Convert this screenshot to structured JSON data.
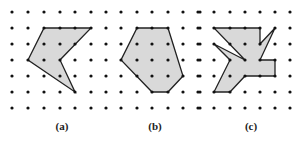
{
  "figure": {
    "colors": {
      "dot": "#111111",
      "fill": "#d9d9d9",
      "stroke": "#222222"
    },
    "panels": [
      {
        "label": "(a)",
        "label_x": 62,
        "grid": {
          "xs": [
            12,
            28,
            44,
            60,
            75,
            91
          ],
          "ys": [
            12,
            28,
            44,
            60,
            76,
            92,
            108
          ]
        },
        "polygon": [
          [
            44,
            28
          ],
          [
            91,
            28
          ],
          [
            60,
            60
          ],
          [
            75,
            92
          ],
          [
            28,
            60
          ]
        ]
      },
      {
        "label": "(b)",
        "label_x": 155,
        "grid": {
          "xs": [
            106,
            121,
            137,
            152,
            168,
            183,
            198
          ],
          "ys": [
            12,
            28,
            44,
            60,
            76,
            92,
            108
          ]
        },
        "polygon": [
          [
            137,
            28
          ],
          [
            168,
            28
          ],
          [
            183,
            76
          ],
          [
            168,
            92
          ],
          [
            152,
            92
          ],
          [
            121,
            60
          ]
        ]
      },
      {
        "label": "(c)",
        "label_x": 251,
        "grid": {
          "xs": [
            200,
            214,
            230,
            245,
            260,
            275,
            290
          ],
          "ys": [
            12,
            28,
            44,
            60,
            76,
            92,
            108
          ]
        },
        "polygon": [
          [
            214,
            28
          ],
          [
            260,
            28
          ],
          [
            260,
            44
          ],
          [
            275,
            28
          ],
          [
            260,
            60
          ],
          [
            275,
            60
          ],
          [
            275,
            76
          ],
          [
            245,
            76
          ],
          [
            230,
            92
          ],
          [
            214,
            92
          ],
          [
            230,
            60
          ],
          [
            214,
            44
          ],
          [
            245,
            60
          ]
        ]
      }
    ]
  }
}
